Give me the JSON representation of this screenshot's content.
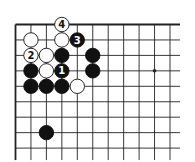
{
  "diagram": {
    "type": "go-board",
    "columns": 11,
    "rows": 9,
    "edges": {
      "top": true,
      "left": true,
      "right": false,
      "bottom": false
    },
    "star_points": [
      {
        "col": 9,
        "row": 3
      }
    ],
    "colors": {
      "black": "#111111",
      "white": "#ffffff",
      "line": "#222222",
      "label_on_black": "#ffffff",
      "label_on_white": "#111111"
    },
    "stones": [
      {
        "col": 3,
        "row": 0,
        "color": "white",
        "label": "4"
      },
      {
        "col": 1,
        "row": 1,
        "color": "white",
        "label": ""
      },
      {
        "col": 3,
        "row": 1,
        "color": "white",
        "label": ""
      },
      {
        "col": 4,
        "row": 1,
        "color": "black",
        "label": "3"
      },
      {
        "col": 1,
        "row": 2,
        "color": "white",
        "label": "2"
      },
      {
        "col": 2,
        "row": 2,
        "color": "white",
        "label": ""
      },
      {
        "col": 3,
        "row": 2,
        "color": "black",
        "label": ""
      },
      {
        "col": 5,
        "row": 2,
        "color": "black",
        "label": ""
      },
      {
        "col": 1,
        "row": 3,
        "color": "black",
        "label": ""
      },
      {
        "col": 2,
        "row": 3,
        "color": "white",
        "label": ""
      },
      {
        "col": 3,
        "row": 3,
        "color": "black",
        "label": "1"
      },
      {
        "col": 5,
        "row": 3,
        "color": "black",
        "label": ""
      },
      {
        "col": 1,
        "row": 4,
        "color": "black",
        "label": ""
      },
      {
        "col": 2,
        "row": 4,
        "color": "black",
        "label": ""
      },
      {
        "col": 3,
        "row": 4,
        "color": "black",
        "label": ""
      },
      {
        "col": 4,
        "row": 4,
        "color": "white",
        "label": ""
      },
      {
        "col": 2,
        "row": 7,
        "color": "black",
        "label": ""
      }
    ]
  }
}
